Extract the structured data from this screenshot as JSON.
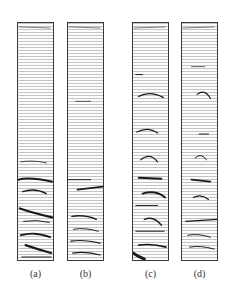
{
  "figure": {
    "panels": [
      {
        "id": "a",
        "label": "(a)"
      },
      {
        "id": "b",
        "label": "(b)"
      },
      {
        "id": "c",
        "label": "(c)"
      },
      {
        "id": "d",
        "label": "(d)"
      }
    ],
    "colors": {
      "border": "#3a3a3a",
      "vectors": "#5a5a5a",
      "streaks": "#1a1a1a",
      "background": "#ffffff"
    }
  }
}
